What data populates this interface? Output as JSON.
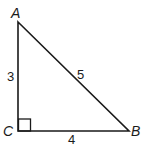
{
  "diagram": {
    "type": "right-triangle",
    "vertices": [
      {
        "name": "A",
        "x": 18,
        "y": 22,
        "label_x": 11,
        "label_y": 18
      },
      {
        "name": "B",
        "x": 129,
        "y": 131,
        "label_x": 131,
        "label_y": 136
      },
      {
        "name": "C",
        "x": 18,
        "y": 131,
        "label_x": 3,
        "label_y": 136
      }
    ],
    "sides": [
      {
        "name": "AC",
        "length_label": "3",
        "label_x": 7,
        "label_y": 81
      },
      {
        "name": "AB",
        "length_label": "5",
        "label_x": 77,
        "label_y": 79
      },
      {
        "name": "CB",
        "length_label": "4",
        "label_x": 68,
        "label_y": 144
      }
    ],
    "right_angle_at": "C",
    "colors": {
      "stroke": "#1a1a1a",
      "background": "#ffffff"
    }
  }
}
